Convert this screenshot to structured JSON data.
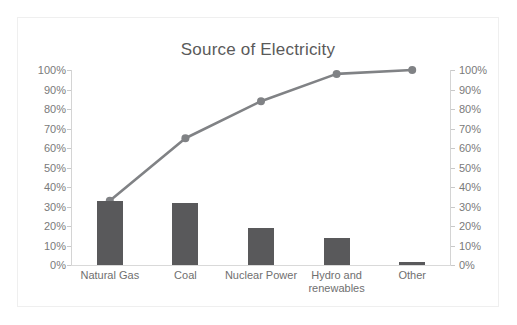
{
  "chart_data": {
    "type": "bar",
    "title": "Source of Electricity",
    "xlabel": "",
    "ylabel": "",
    "ylim": [
      0,
      100
    ],
    "grid": false,
    "legend": "none",
    "categories": [
      "Natural Gas",
      "Coal",
      "Nuclear Power",
      "Hydro and\nrenewables",
      "Other"
    ],
    "series": [
      {
        "name": "Share of electricity",
        "type": "bar",
        "values": [
          33,
          32,
          19,
          14,
          1.5
        ],
        "color": "#59595b"
      },
      {
        "name": "Cumulative percentage",
        "type": "line",
        "values": [
          33,
          65,
          84,
          98,
          100
        ],
        "color": "#808285"
      }
    ],
    "axes": {
      "left": {
        "ticks": [
          100,
          90,
          80,
          70,
          60,
          50,
          40,
          30,
          20,
          10,
          0
        ],
        "tick_labels": [
          "100%",
          "90%",
          "80%",
          "70%",
          "60%",
          "50%",
          "40%",
          "30%",
          "20%",
          "10%",
          "0%"
        ]
      },
      "right": {
        "ticks": [
          100,
          90,
          80,
          70,
          60,
          50,
          40,
          30,
          20,
          10,
          0
        ],
        "tick_labels": [
          "100%",
          "90%",
          "80%",
          "70%",
          "60%",
          "50%",
          "40%",
          "30%",
          "20%",
          "10%",
          "0%"
        ]
      }
    },
    "colors": {
      "bar": "#59595b",
      "line": "#808285",
      "text": "#7a7a7a",
      "title": "#5a5a5a",
      "border": "#efefef",
      "background": "#ffffff"
    }
  }
}
